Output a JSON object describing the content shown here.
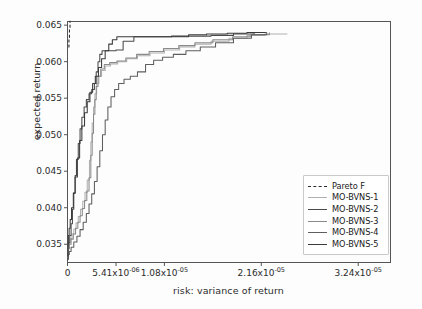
{
  "chart_data": {
    "type": "line",
    "title": "",
    "xlabel": "risk: variance of return",
    "ylabel": "expected return",
    "grid": false,
    "legend_position": "center right inside axes",
    "xlim": [
      0.0,
      3.6e-05
    ],
    "ylim": [
      0.0325,
      0.0655
    ],
    "xticks": [
      0.0,
      5.41e-06,
      1.08e-05,
      2.16e-05,
      3.24e-05
    ],
    "xticklabels": [
      "0",
      "5.41x10",
      "1.08x10",
      "2.16x10",
      "3.24x10"
    ],
    "xtick_exponents": [
      "",
      "-06",
      "-05",
      "-05",
      "-05"
    ],
    "yticks": [
      0.035,
      0.04,
      0.045,
      0.05,
      0.055,
      0.06,
      0.065
    ],
    "yticklabels": [
      "0.035",
      "0.040",
      "0.045",
      "0.050",
      "0.055",
      "0.060",
      "0.065"
    ],
    "series": [
      {
        "name": "Pareto F",
        "style": "dashed",
        "color": "#2b2b2b",
        "points": [
          [
            1e-07,
            0.062
          ],
          [
            1.6e-07,
            0.0633
          ],
          [
            2.2e-07,
            0.0645
          ],
          [
            2.8e-07,
            0.0656
          ]
        ]
      },
      {
        "name": "MO-BVNS-1",
        "style": "solid",
        "color": "#b0b0b0",
        "points": [
          [
            5e-08,
            0.0331
          ],
          [
            1e-07,
            0.0347
          ],
          [
            1.8e-07,
            0.0352
          ],
          [
            3e-07,
            0.0358
          ],
          [
            5e-07,
            0.0364
          ],
          [
            7e-07,
            0.0371
          ],
          [
            9.5e-07,
            0.0379
          ],
          [
            1.2e-06,
            0.0388
          ],
          [
            1.45e-06,
            0.0398
          ],
          [
            1.7e-06,
            0.0409
          ],
          [
            1.95e-06,
            0.0421
          ],
          [
            2.2e-06,
            0.0438
          ],
          [
            2.45e-06,
            0.0465
          ],
          [
            2.6e-06,
            0.049
          ],
          [
            2.75e-06,
            0.0516
          ],
          [
            2.9e-06,
            0.0538
          ],
          [
            3.05e-06,
            0.0556
          ],
          [
            3.25e-06,
            0.057
          ],
          [
            3.5e-06,
            0.058
          ],
          [
            3.8e-06,
            0.0588
          ],
          [
            4.2e-06,
            0.0594
          ],
          [
            4.8e-06,
            0.0597
          ],
          [
            5.6e-06,
            0.06
          ],
          [
            6.6e-06,
            0.0604
          ],
          [
            7.8e-06,
            0.0608
          ],
          [
            9.2e-06,
            0.0612
          ],
          [
            1.08e-05,
            0.0616
          ],
          [
            1.25e-05,
            0.062
          ],
          [
            1.42e-05,
            0.0624
          ],
          [
            1.6e-05,
            0.0628
          ],
          [
            1.8e-05,
            0.0632
          ],
          [
            2e-05,
            0.0636
          ],
          [
            2.2e-05,
            0.0638
          ],
          [
            2.45e-05,
            0.0638
          ]
        ]
      },
      {
        "name": "MO-BVNS-2",
        "style": "solid",
        "color": "#4a4a4a",
        "points": [
          [
            4e-08,
            0.033
          ],
          [
            8e-08,
            0.0344
          ],
          [
            1.5e-07,
            0.0352
          ],
          [
            2.5e-07,
            0.0362
          ],
          [
            4e-07,
            0.0378
          ],
          [
            5.5e-07,
            0.0398
          ],
          [
            7e-07,
            0.042
          ],
          [
            8.5e-07,
            0.0444
          ],
          [
            1e-06,
            0.0466
          ],
          [
            1.2e-06,
            0.0488
          ],
          [
            1.4e-06,
            0.0508
          ],
          [
            1.6e-06,
            0.0524
          ],
          [
            1.85e-06,
            0.0538
          ],
          [
            2.1e-06,
            0.0548
          ],
          [
            2.4e-06,
            0.0556
          ],
          [
            2.7e-06,
            0.0562
          ],
          [
            3e-06,
            0.057
          ],
          [
            3.2e-06,
            0.0586
          ],
          [
            3.4e-06,
            0.06
          ],
          [
            3.6e-06,
            0.061
          ],
          [
            3.85e-06,
            0.0615
          ],
          [
            4.6e-06,
            0.0615
          ],
          [
            5.4e-06,
            0.0616
          ],
          [
            6.2e-06,
            0.0628
          ],
          [
            7.4e-06,
            0.0634
          ],
          [
            9e-06,
            0.0634
          ],
          [
            1.12e-05,
            0.0634
          ],
          [
            1.35e-05,
            0.0635
          ],
          [
            1.6e-05,
            0.0636
          ],
          [
            1.85e-05,
            0.0638
          ],
          [
            2.08e-05,
            0.064
          ],
          [
            2.22e-05,
            0.064
          ]
        ]
      },
      {
        "name": "MO-BVNS-3",
        "style": "solid",
        "color": "#8a8a8a",
        "points": [
          [
            5e-08,
            0.0332
          ],
          [
            1.2e-07,
            0.0344
          ],
          [
            2.2e-07,
            0.035
          ],
          [
            4e-07,
            0.0357
          ],
          [
            6.5e-07,
            0.0364
          ],
          [
            9e-07,
            0.0372
          ],
          [
            1.15e-06,
            0.038
          ],
          [
            1.4e-06,
            0.0389
          ],
          [
            1.65e-06,
            0.0399
          ],
          [
            1.9e-06,
            0.041
          ],
          [
            2.15e-06,
            0.0423
          ],
          [
            2.4e-06,
            0.0441
          ],
          [
            2.6e-06,
            0.0472
          ],
          [
            2.75e-06,
            0.0502
          ],
          [
            2.9e-06,
            0.0528
          ],
          [
            3.05e-06,
            0.0548
          ],
          [
            3.2e-06,
            0.0566
          ],
          [
            3.4e-06,
            0.058
          ],
          [
            3.7e-06,
            0.059
          ],
          [
            4.1e-06,
            0.0596
          ],
          [
            4.7e-06,
            0.0599
          ],
          [
            5.5e-06,
            0.0601
          ],
          [
            6.5e-06,
            0.0605
          ],
          [
            7.7e-06,
            0.061
          ],
          [
            9.1e-06,
            0.0614
          ],
          [
            1.07e-05,
            0.0618
          ],
          [
            1.24e-05,
            0.0622
          ],
          [
            1.42e-05,
            0.0626
          ],
          [
            1.62e-05,
            0.063
          ],
          [
            1.84e-05,
            0.0634
          ],
          [
            2.05e-05,
            0.0637
          ],
          [
            2.25e-05,
            0.064
          ]
        ]
      },
      {
        "name": "MO-BVNS-4",
        "style": "solid",
        "color": "#5e5e5e",
        "points": [
          [
            4e-08,
            0.0329
          ],
          [
            9e-08,
            0.0336
          ],
          [
            2e-07,
            0.034
          ],
          [
            4e-07,
            0.0346
          ],
          [
            7e-07,
            0.0353
          ],
          [
            1.05e-06,
            0.0361
          ],
          [
            1.4e-06,
            0.037
          ],
          [
            1.75e-06,
            0.038
          ],
          [
            2.1e-06,
            0.0392
          ],
          [
            2.4e-06,
            0.0405
          ],
          [
            2.7e-06,
            0.0419
          ],
          [
            3e-06,
            0.0436
          ],
          [
            3.3e-06,
            0.0456
          ],
          [
            3.6e-06,
            0.0478
          ],
          [
            3.9e-06,
            0.05
          ],
          [
            4.2e-06,
            0.052
          ],
          [
            4.5e-06,
            0.0538
          ],
          [
            4.85e-06,
            0.0552
          ],
          [
            5.25e-06,
            0.0562
          ],
          [
            5.7e-06,
            0.057
          ],
          [
            6.3e-06,
            0.0576
          ],
          [
            7e-06,
            0.058
          ],
          [
            7.8e-06,
            0.0586
          ],
          [
            8.7e-06,
            0.0596
          ],
          [
            9.6e-06,
            0.0602
          ],
          [
            1.06e-05,
            0.0606
          ],
          [
            1.18e-05,
            0.061
          ],
          [
            1.32e-05,
            0.0615
          ],
          [
            1.48e-05,
            0.062
          ],
          [
            1.65e-05,
            0.0626
          ],
          [
            1.85e-05,
            0.0632
          ],
          [
            2.05e-05,
            0.0637
          ],
          [
            2.22e-05,
            0.064
          ]
        ]
      },
      {
        "name": "MO-BVNS-5",
        "style": "solid",
        "color": "#3a3a3a",
        "points": [
          [
            3e-08,
            0.0334
          ],
          [
            6e-08,
            0.035
          ],
          [
            1e-07,
            0.0362
          ],
          [
            1.8e-07,
            0.0372
          ],
          [
            3e-07,
            0.0384
          ],
          [
            4.5e-07,
            0.04
          ],
          [
            6.5e-07,
            0.042
          ],
          [
            8.5e-07,
            0.0442
          ],
          [
            1.1e-06,
            0.0468
          ],
          [
            1.35e-06,
            0.0492
          ],
          [
            1.6e-06,
            0.0512
          ],
          [
            1.9e-06,
            0.053
          ],
          [
            2.2e-06,
            0.0545
          ],
          [
            2.5e-06,
            0.0558
          ],
          [
            2.8e-06,
            0.057
          ],
          [
            3.1e-06,
            0.058
          ],
          [
            3.45e-06,
            0.0592
          ],
          [
            3.8e-06,
            0.0604
          ],
          [
            4.2e-06,
            0.0615
          ],
          [
            4.6e-06,
            0.0624
          ],
          [
            5e-06,
            0.063
          ],
          [
            5.5e-06,
            0.0634
          ],
          [
            6.5e-06,
            0.0634
          ],
          [
            8e-06,
            0.0634
          ],
          [
            9.8e-06,
            0.0634
          ],
          [
            1.16e-05,
            0.0635
          ],
          [
            1.35e-05,
            0.0637
          ],
          [
            1.55e-05,
            0.0638
          ],
          [
            1.78e-05,
            0.0639
          ],
          [
            2e-05,
            0.064
          ],
          [
            2.2e-05,
            0.064
          ]
        ]
      }
    ]
  },
  "legend": {
    "entries": [
      {
        "label": "Pareto F",
        "color": "#2b2b2b",
        "dashed": true
      },
      {
        "label": "MO-BVNS-1",
        "color": "#b0b0b0",
        "dashed": false
      },
      {
        "label": "MO-BVNS-2",
        "color": "#4a4a4a",
        "dashed": false
      },
      {
        "label": "MO-BVNS-3",
        "color": "#8a8a8a",
        "dashed": false
      },
      {
        "label": "MO-BVNS-4",
        "color": "#5e5e5e",
        "dashed": false
      },
      {
        "label": "MO-BVNS-5",
        "color": "#3a3a3a",
        "dashed": false
      }
    ]
  },
  "axes": {
    "spine_color": "#555555",
    "tick_color": "#555555",
    "background": "#ffffff"
  }
}
